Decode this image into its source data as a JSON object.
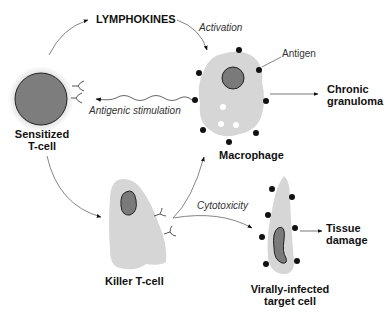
{
  "diagram": {
    "type": "cell-mediated immunity pathway",
    "nodes": {
      "sensitized_tcell": {
        "line1": "Sensitized",
        "line2": "T-cell"
      },
      "macrophage": {
        "label": "Macrophage"
      },
      "killer_tcell": {
        "label": "Killer T-cell"
      },
      "target_cell": {
        "line1": "Virally-infected",
        "line2": "target cell"
      },
      "lymphokines": {
        "label": "LYMPHOKINES"
      },
      "chronic_granuloma": {
        "line1": "Chronic",
        "line2": "granuloma"
      },
      "tissue_damage": {
        "line1": "Tissue",
        "line2": "damage"
      }
    },
    "edge_labels": {
      "activation": "Activation",
      "antigenic_stimulation": "Antigenic stimulation",
      "cytotoxicity": "Cytotoxicity",
      "antigen": "Antigen"
    },
    "edges": [
      {
        "from": "Sensitized T-cell",
        "to": "LYMPHOKINES"
      },
      {
        "from": "LYMPHOKINES",
        "to": "Macrophage",
        "label": "Activation"
      },
      {
        "from": "Macrophage",
        "to": "Sensitized T-cell",
        "label": "Antigenic stimulation"
      },
      {
        "from": "Macrophage",
        "to": "Chronic granuloma"
      },
      {
        "from": "Sensitized T-cell",
        "to": "Killer T-cell"
      },
      {
        "from": "Killer T-cell",
        "to": "Macrophage"
      },
      {
        "from": "Killer T-cell",
        "to": "Virally-infected target cell",
        "label": "Cytotoxicity"
      },
      {
        "from": "Virally-infected target cell",
        "to": "Tissue damage"
      }
    ],
    "colors": {
      "cell_fill": "#d9d9d9",
      "nucleus_fill": "#7a7a7a",
      "antigen_dot": "#111111",
      "line": "#555555"
    }
  }
}
